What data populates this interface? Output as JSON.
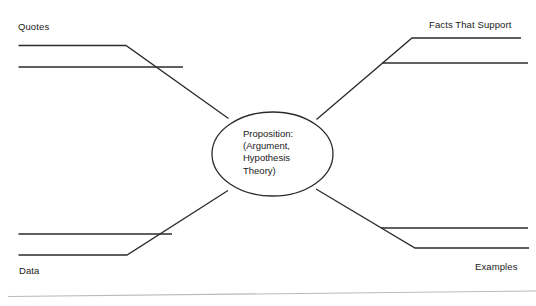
{
  "diagram": {
    "type": "concept-map",
    "title_text": "Proposition Concept Map",
    "center": {
      "shape": "ellipse",
      "lines": [
        "Proposition:",
        "(Argument,",
        "Hypothesis",
        "Theory)"
      ]
    },
    "branches": [
      {
        "id": "quotes",
        "label": "Quotes",
        "position": "top-left"
      },
      {
        "id": "facts",
        "label": "Facts That Support",
        "position": "top-right"
      },
      {
        "id": "data",
        "label": "Data",
        "position": "bottom-left"
      },
      {
        "id": "examples",
        "label": "Examples",
        "position": "bottom-right"
      }
    ],
    "colors": {
      "background": "#ffffff",
      "stroke": "#2b2b2b",
      "text": "#1a1a1a",
      "faint_rule": "#b9b9b9"
    }
  }
}
